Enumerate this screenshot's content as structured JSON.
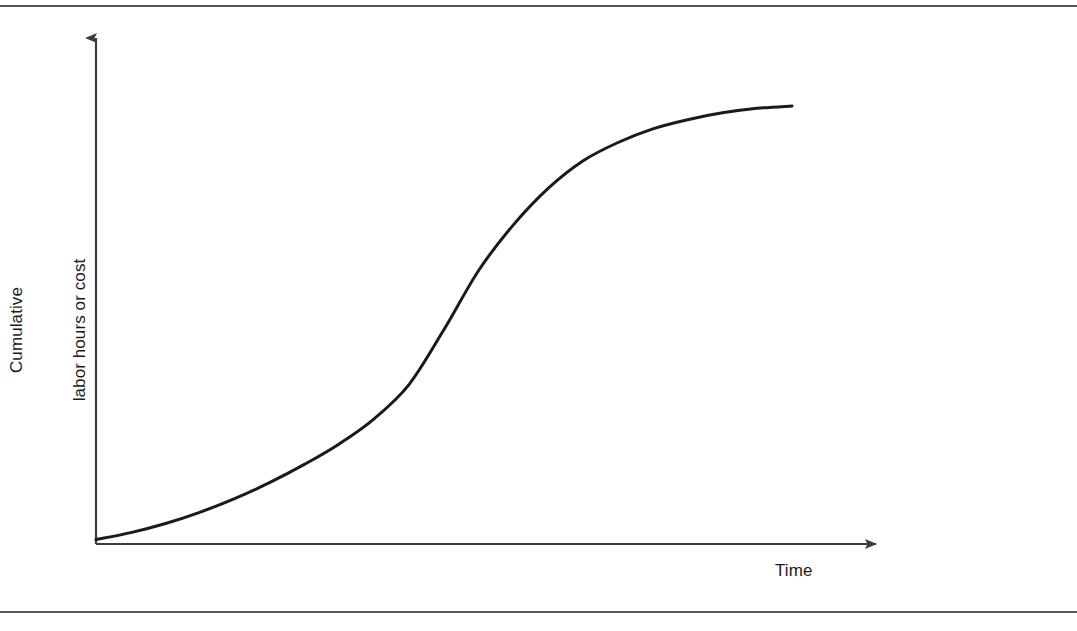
{
  "figure": {
    "background_color": "#ffffff",
    "rule_color": "#555555",
    "curve_color": "#1a1a1a",
    "axis_color": "#3c3c3c",
    "top_rule_label": "top-divider",
    "bottom_rule_label": "bottom-divider"
  },
  "axes": {
    "y_label_line1": "Cumulative",
    "y_label_line2": "labor hours or cost",
    "x_label": "Time",
    "y_arrow": "up-arrow",
    "x_arrow": "right-arrow"
  },
  "chart_data": {
    "type": "line",
    "title": "",
    "subtitle": "",
    "xlabel": "Time",
    "ylabel": "Cumulative labor hours or cost",
    "grid": false,
    "legend": null,
    "legend_position": "none",
    "axis_style": "arrow-axes-no-ticks",
    "xlim": [
      0,
      100
    ],
    "ylim": [
      0,
      100
    ],
    "x_tick_labels": [],
    "y_tick_labels": [],
    "annotations": [],
    "series": [
      {
        "name": "Cumulative progress (S-curve)",
        "shape": "sigmoid",
        "x": [
          0,
          5,
          10,
          15,
          20,
          25,
          30,
          35,
          40,
          45,
          50,
          55,
          60,
          65,
          70,
          75,
          80,
          85,
          90,
          95,
          100
        ],
        "y": [
          1,
          2.5,
          4.5,
          7,
          10,
          13.5,
          17.5,
          22,
          27.5,
          35,
          47,
          60,
          70,
          78,
          84,
          88,
          91,
          93,
          94.5,
          95.5,
          96
        ]
      }
    ],
    "pixel_path": {
      "note": "traced control points in screenshot pixel coordinates",
      "origin": [
        96,
        544
      ],
      "x_axis_end": [
        888,
        544
      ],
      "y_axis_top": [
        96,
        32
      ],
      "curve_start": [
        97,
        538
      ],
      "curve_end": [
        792,
        106
      ],
      "inflection": [
        478,
        275
      ]
    }
  }
}
